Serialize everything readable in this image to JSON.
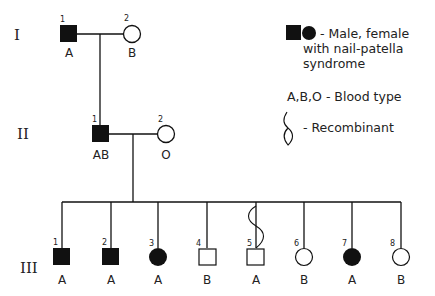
{
  "generations": [
    {
      "label": "I"
    },
    {
      "label": "II"
    },
    {
      "label": "III"
    }
  ],
  "gen1": [
    {
      "number": "1",
      "sex": "male",
      "affected": true,
      "blood_type": "A"
    },
    {
      "number": "2",
      "sex": "female",
      "affected": false,
      "blood_type": "B"
    }
  ],
  "gen2": [
    {
      "number": "1",
      "sex": "male",
      "affected": true,
      "blood_type": "AB"
    },
    {
      "number": "2",
      "sex": "female",
      "affected": false,
      "blood_type": "O"
    }
  ],
  "gen3": [
    {
      "number": "1",
      "sex": "male",
      "affected": true,
      "blood_type": "A",
      "recombinant": false
    },
    {
      "number": "2",
      "sex": "male",
      "affected": true,
      "blood_type": "A",
      "recombinant": false
    },
    {
      "number": "3",
      "sex": "female",
      "affected": true,
      "blood_type": "A",
      "recombinant": false
    },
    {
      "number": "4",
      "sex": "male",
      "affected": false,
      "blood_type": "B",
      "recombinant": false
    },
    {
      "number": "5",
      "sex": "male",
      "affected": false,
      "blood_type": "A",
      "recombinant": true
    },
    {
      "number": "6",
      "sex": "female",
      "affected": false,
      "blood_type": "B",
      "recombinant": false
    },
    {
      "number": "7",
      "sex": "female",
      "affected": true,
      "blood_type": "A",
      "recombinant": false
    },
    {
      "number": "8",
      "sex": "female",
      "affected": false,
      "blood_type": "B",
      "recombinant": false
    }
  ],
  "legend": {
    "affected_line1": "- Male, female",
    "affected_line2": "with nail-patella",
    "affected_line3": "syndrome",
    "blood_type": "A,B,O -  Blood type",
    "recombinant": "- Recombinant"
  },
  "colors": {
    "ink": "#111111",
    "background": "#ffffff"
  }
}
